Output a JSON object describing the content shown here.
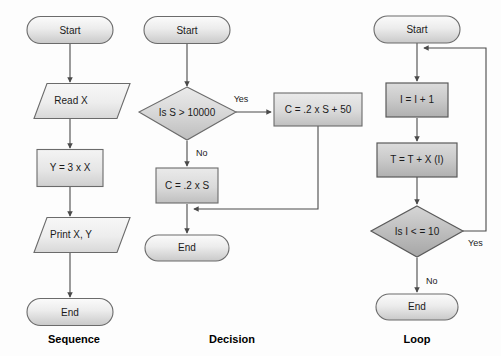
{
  "figure": {
    "background_color": "#fdfdfd",
    "outline_color": "#6b6b6b",
    "connector_color": "#4a4a4a",
    "text_color": "#1a1a1a"
  },
  "columns": [
    {
      "caption": "Sequence",
      "caption_x": 74,
      "caption_y": 340,
      "nodes": [
        {
          "id": "seq-start",
          "type": "terminator",
          "label": "Start",
          "cx": 70,
          "cy": 30,
          "w": 86,
          "h": 27,
          "fill": "#e8e8e8"
        },
        {
          "id": "seq-read",
          "type": "parallelogram",
          "label": "Read X",
          "cx": 70,
          "cy": 101,
          "w": 92,
          "h": 35,
          "fill": "#e9e9e9"
        },
        {
          "id": "seq-assign",
          "type": "process",
          "label": "Y = 3 x X",
          "cx": 70,
          "cy": 168,
          "w": 66,
          "h": 37,
          "fill": "#e4e4e4"
        },
        {
          "id": "seq-print",
          "type": "parallelogram",
          "label": "Print X, Y",
          "cx": 70,
          "cy": 235,
          "w": 92,
          "h": 35,
          "fill": "#e9e9e9"
        },
        {
          "id": "seq-end",
          "type": "terminator",
          "label": "End",
          "cx": 70,
          "cy": 312,
          "w": 86,
          "h": 27,
          "fill": "#e8e8e8"
        }
      ],
      "edges": [
        {
          "id": "seq-e1",
          "from": "seq-start",
          "to": "seq-read",
          "label": ""
        },
        {
          "id": "seq-e2",
          "from": "seq-read",
          "to": "seq-assign",
          "label": ""
        },
        {
          "id": "seq-e3",
          "from": "seq-assign",
          "to": "seq-print",
          "label": ""
        },
        {
          "id": "seq-e4",
          "from": "seq-print",
          "to": "seq-end",
          "label": ""
        }
      ]
    },
    {
      "caption": "Decision",
      "caption_x": 232,
      "caption_y": 340,
      "nodes": [
        {
          "id": "dec-start",
          "type": "terminator",
          "label": "Start",
          "cx": 187,
          "cy": 30,
          "w": 86,
          "h": 27,
          "fill": "#e8e8e8"
        },
        {
          "id": "dec-test",
          "type": "diamond",
          "label": "Is S > 10000",
          "cx": 187,
          "cy": 116,
          "w": 96,
          "h": 50,
          "fill": "#d9d9d9"
        },
        {
          "id": "dec-yes",
          "type": "process",
          "label": "C = .2 x S + 50",
          "cx": 318,
          "cy": 109,
          "w": 88,
          "h": 33,
          "fill": "#dddddd"
        },
        {
          "id": "dec-no",
          "type": "process",
          "label": "C = .2 x S",
          "cx": 187,
          "cy": 186,
          "w": 62,
          "h": 35,
          "fill": "#d6d6d6"
        },
        {
          "id": "dec-end",
          "type": "terminator",
          "label": "End",
          "cx": 187,
          "cy": 248,
          "w": 84,
          "h": 26,
          "fill": "#e8e8e8"
        }
      ],
      "edges": [
        {
          "id": "dec-e1",
          "from": "dec-start",
          "to": "dec-test",
          "label": ""
        },
        {
          "id": "dec-e2",
          "from": "dec-test",
          "to": "dec-yes",
          "label": "Yes",
          "label_x": 247,
          "label_y": 100
        },
        {
          "id": "dec-e3",
          "from": "dec-test",
          "to": "dec-no",
          "label": "No",
          "label_x": 194,
          "label_y": 152
        },
        {
          "id": "dec-e4",
          "from": "dec-no",
          "to": "dec-end",
          "label": ""
        },
        {
          "id": "dec-e5",
          "from": "dec-yes",
          "to": "dec-end",
          "label": ""
        }
      ]
    },
    {
      "caption": "Loop",
      "caption_x": 417,
      "caption_y": 340,
      "nodes": [
        {
          "id": "loop-start",
          "type": "terminator",
          "label": "Start",
          "cx": 417,
          "cy": 29,
          "w": 86,
          "h": 27,
          "fill": "#e8e8e8"
        },
        {
          "id": "loop-incr",
          "type": "process",
          "label": "I = I + 1",
          "cx": 417,
          "cy": 100,
          "w": 62,
          "h": 34,
          "fill": "#cfcfcf"
        },
        {
          "id": "loop-sum",
          "type": "process",
          "label": "T = T +  X (I)",
          "cx": 417,
          "cy": 160,
          "w": 80,
          "h": 34,
          "fill": "#cacaca"
        },
        {
          "id": "loop-test",
          "type": "diamond",
          "label": "Is I < = 10",
          "cx": 417,
          "cy": 232,
          "w": 92,
          "h": 50,
          "fill": "#bfbfbf"
        },
        {
          "id": "loop-end",
          "type": "terminator",
          "label": "End",
          "cx": 417,
          "cy": 307,
          "w": 82,
          "h": 26,
          "fill": "#e0e0e0"
        }
      ],
      "edges": [
        {
          "id": "loop-e1",
          "from": "loop-start",
          "to": "loop-incr",
          "label": ""
        },
        {
          "id": "loop-e2",
          "from": "loop-incr",
          "to": "loop-sum",
          "label": ""
        },
        {
          "id": "loop-e3",
          "from": "loop-sum",
          "to": "loop-test",
          "label": ""
        },
        {
          "id": "loop-e4",
          "from": "loop-test",
          "to": "loop-end",
          "label": "No",
          "label_x": 424,
          "label_y": 280
        },
        {
          "id": "loop-e5",
          "from": "loop-test",
          "to": "loop-incr",
          "label": "Yes",
          "label_x": 468,
          "label_y": 243
        }
      ]
    }
  ]
}
